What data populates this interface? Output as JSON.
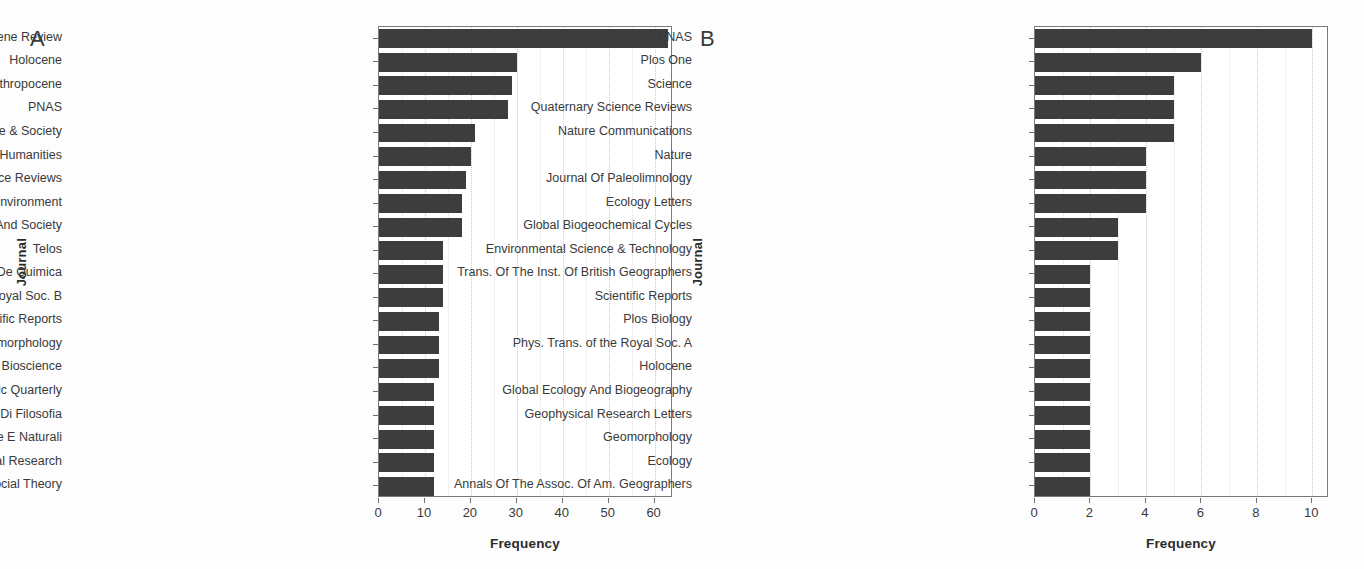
{
  "figure": {
    "background": "#fdfdfd",
    "bar_color": "#3d3d3d",
    "axis_color": "#7a7a7a",
    "grid_color": "#c9c9c9"
  },
  "panels": [
    {
      "letter": "A",
      "ylabel": "Journal",
      "xlabel": "Frequency"
    },
    {
      "letter": "B",
      "ylabel": "Journal",
      "xlabel": "Frequency"
    }
  ],
  "chart_data": [
    {
      "type": "bar",
      "orientation": "horizontal",
      "panel": "A",
      "title": "",
      "xlabel": "Frequency",
      "ylabel": "Journal",
      "xlim": [
        0,
        64
      ],
      "xticks": [
        0,
        10,
        20,
        30,
        40,
        50,
        60
      ],
      "xtick_labels": [
        "0",
        "10",
        "20",
        "30",
        "40",
        "50",
        "60"
      ],
      "grid": true,
      "legend": "none",
      "categories": [
        "Anthropocene Review",
        "Holocene",
        "Anthropocene",
        "PNAS",
        "Theory Culture & Society",
        "Environmental Humanities",
        "Quaternary Science Reviews",
        "Science Of The Total Environment",
        "Ecology And Society",
        "Telos",
        "Revista Virtual De Quimica",
        "Phys. Trans. of the Royal Soc. B",
        "Scientific Reports",
        "Geomorphology",
        "Bioscience",
        "South Atlantic Quarterly",
        "Sguardo-rivista Di Filosofia",
        "Rendiconti Lincei-scienze Fisiche E Naturali",
        "Geographical Research",
        "European Journal Of Social Theory"
      ],
      "values": [
        63,
        30,
        29,
        28,
        21,
        20,
        19,
        18,
        18,
        14,
        14,
        14,
        13,
        13,
        13,
        12,
        12,
        12,
        12,
        12
      ]
    },
    {
      "type": "bar",
      "orientation": "horizontal",
      "panel": "B",
      "title": "",
      "xlabel": "Frequency",
      "ylabel": "Journal",
      "xlim": [
        0,
        10.6
      ],
      "xticks": [
        0,
        2,
        4,
        6,
        8,
        10
      ],
      "xtick_labels": [
        "0",
        "2",
        "4",
        "6",
        "8",
        "10"
      ],
      "grid": true,
      "legend": "none",
      "categories": [
        "PNAS",
        "Plos One",
        "Science",
        "Quaternary Science Reviews",
        "Nature Communications",
        "Nature",
        "Journal Of Paleolimnology",
        "Ecology Letters",
        "Global Biogeochemical Cycles",
        "Environmental Science & Technology",
        "Trans. Of The Inst. Of British Geographers",
        "Scientific Reports",
        "Plos Biology",
        "Phys. Trans. of the Royal Soc. A",
        "Holocene",
        "Global Ecology And Biogeography",
        "Geophysical Research Letters",
        "Geomorphology",
        "Ecology",
        "Annals Of The Assoc. Of Am. Geographers"
      ],
      "values": [
        10,
        6,
        5,
        5,
        5,
        4,
        4,
        4,
        3,
        3,
        2,
        2,
        2,
        2,
        2,
        2,
        2,
        2,
        2,
        2
      ]
    }
  ]
}
